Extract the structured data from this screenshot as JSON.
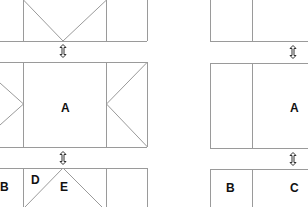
{
  "diagram": {
    "line_color": "#9a9a9a",
    "label_color": "#111111",
    "left_figure": {
      "labels": {
        "middle": "A",
        "bottom_left": "B",
        "bottom_d": "D",
        "bottom_e": "E"
      }
    },
    "right_figure": {
      "labels": {
        "middle": "A",
        "bottom_left": "B",
        "bottom_right": "C"
      }
    },
    "resize_handles": [
      {
        "figure": "left",
        "position": "top-gap"
      },
      {
        "figure": "left",
        "position": "bottom-gap"
      },
      {
        "figure": "right",
        "position": "top-gap"
      },
      {
        "figure": "right",
        "position": "bottom-gap"
      }
    ]
  }
}
